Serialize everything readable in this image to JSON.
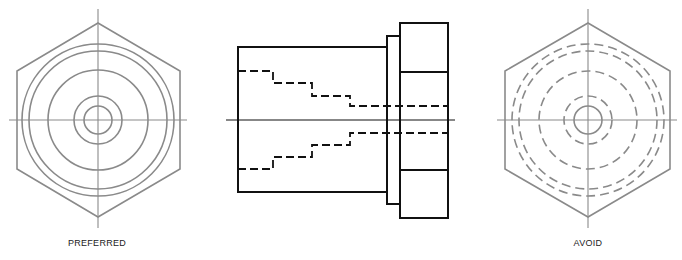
{
  "figures": {
    "left": {
      "label": "PREFERRED",
      "center": [
        98,
        120
      ],
      "hex_half_height": 97,
      "hex_half_width": 81,
      "circles": [
        {
          "r": 76,
          "style": "solid"
        },
        {
          "r": 69,
          "style": "solid"
        },
        {
          "r": 50,
          "style": "solid"
        },
        {
          "r": 24,
          "style": "solid"
        },
        {
          "r": 14,
          "style": "solid"
        }
      ],
      "line_color": "#8a8a8a"
    },
    "middle": {
      "description": "Side view with hidden lines",
      "line_color": "#111111"
    },
    "right": {
      "label": "AVOID",
      "center": [
        588,
        120
      ],
      "hex_half_height": 97,
      "hex_half_width": 82,
      "circles": [
        {
          "r": 76,
          "style": "dashed"
        },
        {
          "r": 69,
          "style": "dashed"
        },
        {
          "r": 49,
          "style": "dashed"
        },
        {
          "r": 24,
          "style": "dashed"
        },
        {
          "r": 14,
          "style": "solid"
        }
      ],
      "line_color": "#8a8a8a"
    }
  }
}
